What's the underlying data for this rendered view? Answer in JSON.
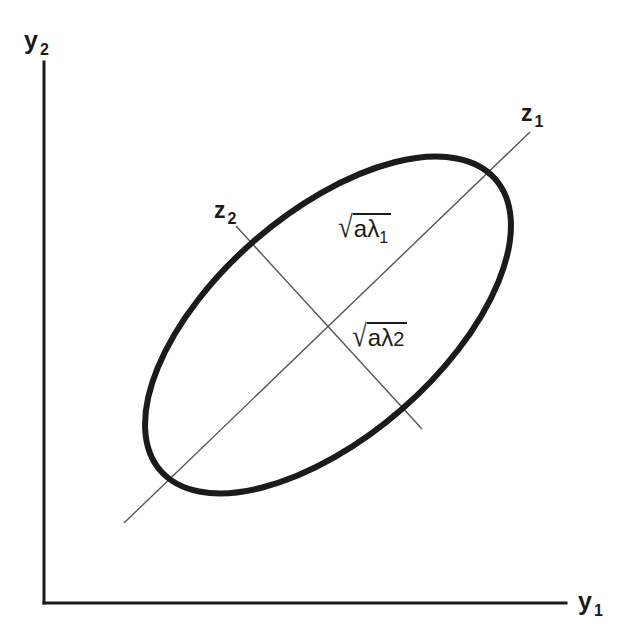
{
  "figure": {
    "background_color": "#ffffff",
    "ink_color": "#1b1b1b",
    "axes": {
      "x_axis_label": "y",
      "x_axis_subscript": "1",
      "y_axis_label": "y",
      "y_axis_subscript": "2",
      "axis_color": "#1b1b1b",
      "axis_stroke_width": 3,
      "origin": [
        44,
        603
      ],
      "x_axis_end": [
        566,
        603
      ],
      "y_axis_top": [
        44,
        62
      ]
    },
    "ellipse": {
      "center": [
        328,
        325
      ],
      "semi_major": 222,
      "semi_minor": 112,
      "rotation_deg": -41,
      "stroke_color": "#1b1b1b",
      "stroke_width": 6,
      "fill": "none"
    },
    "principal_axes": [
      {
        "name": "z1",
        "label": "z",
        "subscript": "1",
        "label_position": [
          521,
          102
        ],
        "line_from": [
          124,
          523
        ],
        "line_to": [
          530,
          132
        ],
        "stroke_color": "#555555",
        "stroke_width": 1.4
      },
      {
        "name": "z2",
        "label": "z",
        "subscript": "2",
        "label_position": [
          214,
          199
        ],
        "line_from": [
          236,
          226
        ],
        "line_to": [
          422,
          429
        ],
        "stroke_color": "#555555",
        "stroke_width": 1.4
      }
    ],
    "annotations": [
      {
        "name": "sqrt-a-lambda-1",
        "radical": "√",
        "base": "aλ",
        "subscript": "1",
        "plain_text": "√(aλ₁)",
        "position": [
          338,
          213
        ]
      },
      {
        "name": "sqrt-a-lambda-2",
        "radical": "√",
        "base": "aλ",
        "subscript": "2",
        "plain_text": "√(aλ₂)",
        "position": [
          352,
          322
        ]
      }
    ]
  }
}
